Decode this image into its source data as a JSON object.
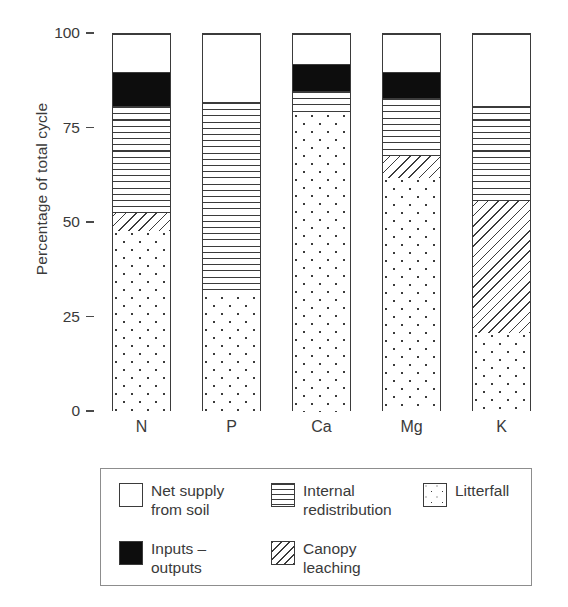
{
  "chart_data": {
    "type": "bar",
    "subtype": "stacked-bar",
    "title": "",
    "xlabel": "",
    "ylabel": "Percentage of total cycle",
    "ylim": [
      0,
      100
    ],
    "yticks": [
      0,
      25,
      50,
      75,
      100
    ],
    "ytick_labels": [
      "0",
      "25",
      "50",
      "75",
      "100"
    ],
    "grid": false,
    "legend_position": "below-plot",
    "categories": [
      "N",
      "P",
      "Ca",
      "Mg",
      "K"
    ],
    "series": [
      {
        "name": "Litterfall",
        "pattern": "dots",
        "values": [
          48,
          31,
          79,
          62,
          21
        ]
      },
      {
        "name": "Canopy leaching",
        "pattern": "diag",
        "values": [
          5,
          0,
          0,
          6,
          35
        ]
      },
      {
        "name": "Internal redistribution",
        "pattern": "hlines",
        "values": [
          28,
          51,
          6,
          15,
          25
        ]
      },
      {
        "name": "Inputs – outputs",
        "pattern": "black",
        "values": [
          9,
          0,
          7,
          7,
          0
        ]
      },
      {
        "name": "Net supply from soil",
        "pattern": "solid",
        "values": [
          10,
          18,
          8,
          10,
          19
        ]
      }
    ],
    "stack_boundaries": {
      "N": [
        0,
        48,
        53,
        81,
        90,
        100
      ],
      "P": [
        0,
        31,
        31,
        82,
        82,
        100
      ],
      "Ca": [
        0,
        79,
        79,
        85,
        92,
        100
      ],
      "Mg": [
        0,
        62,
        68,
        83,
        90,
        100
      ],
      "K": [
        0,
        21,
        56,
        81,
        81,
        100
      ]
    }
  },
  "legend": {
    "items": [
      {
        "label": "Net supply\nfrom soil",
        "label_line1": "Net supply",
        "label_line2": "from soil",
        "pattern": "solid"
      },
      {
        "label": "Internal\nredistribution",
        "label_line1": "Internal",
        "label_line2": "redistribution",
        "pattern": "hlines"
      },
      {
        "label": "Litterfall",
        "label_line1": "Litterfall",
        "label_line2": "",
        "pattern": "dots"
      },
      {
        "label": "Inputs –\noutputs",
        "label_line1": "Inputs –",
        "label_line2": "outputs",
        "pattern": "black"
      },
      {
        "label": "Canopy\nleaching",
        "label_line1": "Canopy",
        "label_line2": "leaching",
        "pattern": "diag"
      }
    ]
  },
  "colors": {
    "ink": "#3b3b3b",
    "black_fill": "#0d0d0d",
    "white_fill": "#ffffff",
    "legend_border": "#8d8d8d",
    "background": "#ffffff"
  }
}
